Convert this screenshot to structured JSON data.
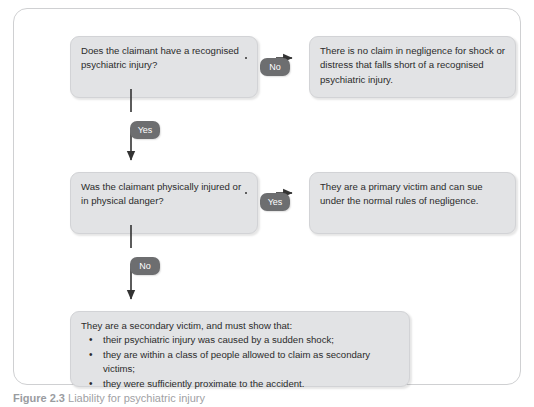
{
  "figure": {
    "caption_label": "Figure",
    "caption_number": "2.3",
    "caption_text": "Liability for psychiatric injury"
  },
  "flowchart": {
    "type": "decision-flowchart",
    "colors": {
      "box_fill": "#e2e3e5",
      "box_border": "#d2d3d6",
      "badge_fill": "#6d6e70",
      "badge_text": "#ffffff",
      "text": "#2b2b2b",
      "frame_border": "#cfd0d2",
      "connector": "#333333",
      "background": "#ffffff"
    },
    "nodes": {
      "question_1": "Does the claimant have a recognised psychiatric injury?",
      "outcome_1": "There is no claim in negligence for shock or distress that falls short of a recognised psychiatric injury.",
      "question_2": "Was the claimant physically injured or in physical danger?",
      "outcome_2": "They are a primary victim and can sue under the normal rules of negligence.",
      "final_lead": "They are a secondary victim, and must show that:",
      "final_bullets": [
        "their psychiatric injury was caused by a sudden shock;",
        "they are within a class of people allowed to claim as secondary victims;",
        "they were sufficiently proximate to the accident."
      ]
    },
    "edges": {
      "q1_to_outcome1": "No",
      "q1_to_q2": "Yes",
      "q2_to_outcome2": "Yes",
      "q2_to_final": "No"
    }
  }
}
